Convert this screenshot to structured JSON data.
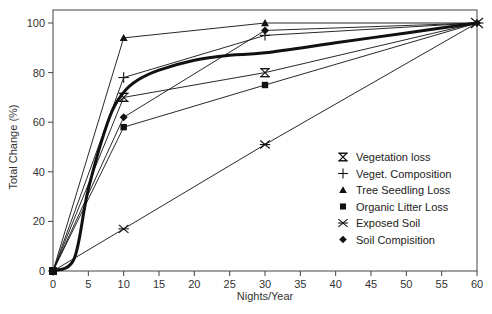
{
  "chart_data": {
    "type": "line",
    "title": "",
    "xlabel": "Nights/Year",
    "ylabel": "Total Change (%)",
    "xlim": [
      0,
      60
    ],
    "ylim": [
      0,
      105
    ],
    "xticks": [
      0,
      5,
      10,
      15,
      20,
      25,
      30,
      35,
      40,
      45,
      50,
      55,
      60
    ],
    "yticks": [
      0,
      20,
      40,
      60,
      80,
      100
    ],
    "grid": false,
    "legend_position": "lower right (inside)",
    "series": [
      {
        "name": "Vegetation loss",
        "marker": "hourglass",
        "x": [
          0,
          10,
          30,
          60
        ],
        "y": [
          0,
          70,
          80,
          100
        ]
      },
      {
        "name": "Veget. Composition",
        "marker": "plus",
        "x": [
          0,
          10,
          30,
          60
        ],
        "y": [
          0,
          78,
          95,
          100
        ]
      },
      {
        "name": "Tree Seedling Loss",
        "marker": "triangle",
        "x": [
          0,
          10,
          30,
          60
        ],
        "y": [
          0,
          94,
          100,
          100
        ]
      },
      {
        "name": "Organic Litter Loss",
        "marker": "square",
        "x": [
          0,
          10,
          30,
          60
        ],
        "y": [
          0,
          58,
          75,
          100
        ]
      },
      {
        "name": "Exposed Soil",
        "marker": "x",
        "x": [
          0,
          10,
          30,
          60
        ],
        "y": [
          0,
          17,
          51,
          100
        ]
      },
      {
        "name": "Soil Compisition",
        "marker": "diamond",
        "x": [
          0,
          10,
          30,
          60
        ],
        "y": [
          0,
          62,
          97,
          100
        ]
      },
      {
        "name": "Mean trend (thick curve)",
        "marker": "none",
        "x": [
          0,
          3,
          5,
          8,
          10,
          12,
          15,
          20,
          25,
          30,
          40,
          50,
          60
        ],
        "y": [
          0,
          5,
          33,
          62,
          72,
          77,
          81,
          85,
          87,
          88,
          92,
          96,
          100
        ]
      }
    ]
  },
  "legend": {
    "items": [
      {
        "label": "Vegetation loss",
        "marker": "hourglass"
      },
      {
        "label": "Veget. Composition",
        "marker": "plus"
      },
      {
        "label": "Tree Seedling Loss",
        "marker": "triangle"
      },
      {
        "label": "Organic Litter Loss",
        "marker": "square"
      },
      {
        "label": "Exposed Soil",
        "marker": "x"
      },
      {
        "label": "Soil Compisition",
        "marker": "diamond"
      }
    ]
  },
  "axes": {
    "x_label": "Nights/Year",
    "y_label": "Total Change (%)"
  }
}
